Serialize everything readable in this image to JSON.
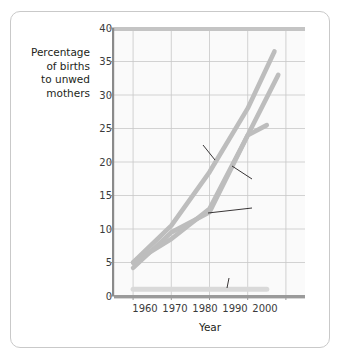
{
  "chart_data": {
    "type": "line",
    "title": "",
    "xlabel": "Year",
    "ylabel": "Percentage of births to unwed mothers",
    "ylabel_lines": [
      "Percentage",
      "of births",
      "to unwed",
      "mothers"
    ],
    "xlim": [
      1955,
      2005
    ],
    "ylim": [
      0,
      40
    ],
    "grid": true,
    "legend": "annotations-inline",
    "xticks": [
      "1960",
      "1970",
      "1980",
      "1990",
      "2000"
    ],
    "xtick_values": [
      1960,
      1970,
      1980,
      1990,
      2000
    ],
    "yticks": [
      "0",
      "5",
      "10",
      "15",
      "20",
      "25",
      "30",
      "35",
      "40"
    ],
    "ytick_values": [
      0,
      5,
      10,
      15,
      20,
      25,
      30,
      35,
      40
    ],
    "line_color": "#bdbdbd",
    "japan_color": "#d9d9d9",
    "series": [
      {
        "name": "United States",
        "x": [
          1960,
          1970,
          1980,
          1990,
          1997
        ],
        "values": [
          5.0,
          10.5,
          18.5,
          28.0,
          36.5
        ]
      },
      {
        "name": "Canada",
        "x": [
          1960,
          1970,
          1980,
          1990,
          1998
        ],
        "values": [
          4.2,
          9.5,
          12.5,
          24.0,
          33.0
        ]
      },
      {
        "name": "Britain",
        "x": [
          1960,
          1970,
          1980,
          1990,
          1995
        ],
        "values": [
          5.0,
          8.5,
          13.0,
          24.0,
          25.5
        ]
      },
      {
        "name": "Japan",
        "x": [
          1960,
          1980,
          1995
        ],
        "values": [
          1.0,
          1.0,
          1.0
        ]
      }
    ],
    "annotations": [
      {
        "label": "United States",
        "x": 1976,
        "y": 23.0
      },
      {
        "label": "Canada",
        "x": 1992,
        "y": 17.5
      },
      {
        "label": "Britain",
        "x": 1992,
        "y": 12.6
      },
      {
        "label": "Japan",
        "x": 1987,
        "y": 3.4
      }
    ]
  }
}
